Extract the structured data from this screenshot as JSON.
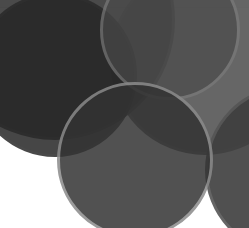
{
  "image": {
    "description": "Abstract composition of overlapping translucent dark gray circles on a white background",
    "width": 249,
    "height": 228,
    "background": "#ffffff",
    "top_strip_color": "#f4f4f4"
  },
  "circles": [
    {
      "name": "circle-top-right-large",
      "cx": 205,
      "cy": 60,
      "r": 95,
      "fill": "#5e5e5e",
      "opacity": 0.95,
      "border": "#6a6a6a"
    },
    {
      "name": "circle-top-left-large",
      "cx": 55,
      "cy": 20,
      "r": 120,
      "fill": "#3c3c3c",
      "opacity": 0.92,
      "border": "#4a4a4a"
    },
    {
      "name": "circle-left-dark",
      "cx": 55,
      "cy": 75,
      "r": 82,
      "fill": "#262626",
      "opacity": 0.85,
      "border": "#2a2a2a"
    },
    {
      "name": "circle-upper-middle",
      "cx": 170,
      "cy": 30,
      "r": 70,
      "fill": "#4a4a4a",
      "opacity": 0.7,
      "border": "#7a7a7a"
    },
    {
      "name": "circle-right-edge",
      "cx": 290,
      "cy": 170,
      "r": 85,
      "fill": "#3e3e3e",
      "opacity": 0.9,
      "border": "#555555"
    },
    {
      "name": "circle-bottom-center",
      "cx": 135,
      "cy": 160,
      "r": 78,
      "fill": "#333333",
      "opacity": 0.85,
      "border": "#8a8a8a"
    }
  ]
}
